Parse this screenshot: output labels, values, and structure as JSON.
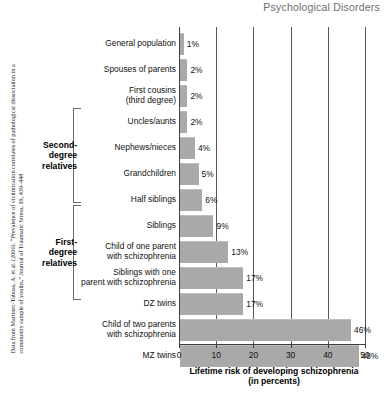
{
  "header": {
    "title": "Psychological Disorders"
  },
  "source": {
    "note": "Data from Martinez-Taboas, A. et al. (2006). “Prevalence of victimization correlates of pathological dissociation in a community sample of youths,” Journal of Traumatic Stress, 19, 439–448"
  },
  "groups": [
    {
      "label": "Second-\ndegree\nrelatives",
      "top": 108,
      "height": 95
    },
    {
      "label": "First-\ndegree\nrelatives",
      "top": 205,
      "height": 95
    }
  ],
  "chart_data": {
    "type": "bar",
    "orientation": "horizontal",
    "title": "Psychological Disorders",
    "xlabel": "Lifetime risk of developing schizophrenia\n(in percents)",
    "ylabel": "",
    "xlim": [
      0,
      50
    ],
    "xticks": [
      0,
      10,
      20,
      30,
      40,
      50
    ],
    "grid": "vertical",
    "legend": "none",
    "categories": [
      "General population",
      "Spouses of parents",
      "First cousins\n(third degree)",
      "Uncles/aunts",
      "Nephews/nieces",
      "Grandchildren",
      "Half siblings",
      "Siblings",
      "Child of one parent\nwith schizophrenia",
      "Siblings with one\nparent with schizophrenia",
      "DZ twins",
      "Child of two parents\nwith schizophrenia",
      "MZ twins"
    ],
    "values": [
      1,
      2,
      2,
      2,
      4,
      5,
      6,
      9,
      13,
      17,
      17,
      46,
      48
    ],
    "value_labels": [
      "1%",
      "2%",
      "2%",
      "2%",
      "4%",
      "5%",
      "6%",
      "9%",
      "13%",
      "17%",
      "17%",
      "46%",
      "48%"
    ],
    "bar_color": "#a9a9a9"
  }
}
